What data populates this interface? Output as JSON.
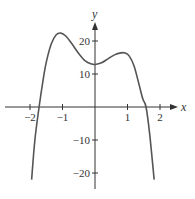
{
  "chart_data": {
    "type": "line",
    "title": "",
    "xlabel": "x",
    "ylabel": "y",
    "xlim": [
      -2.3,
      2.5
    ],
    "ylim": [
      -25,
      26
    ],
    "grid": false,
    "legend": null,
    "x_ticks": [
      -2,
      -1,
      1,
      2
    ],
    "x_tick_labels": [
      "−2",
      "−1",
      "1",
      "2"
    ],
    "y_ticks": [
      20,
      10,
      -10,
      -20
    ],
    "y_tick_labels": [
      "20",
      "10",
      "−10",
      "−20"
    ],
    "series": [
      {
        "name": "f(x)",
        "color": "#555555",
        "points": [
          [
            -1.95,
            -22
          ],
          [
            -1.85,
            -10
          ],
          [
            -1.72,
            0
          ],
          [
            -1.6,
            8
          ],
          [
            -1.5,
            13.5
          ],
          [
            -1.35,
            19
          ],
          [
            -1.2,
            21.8
          ],
          [
            -1.05,
            22.4
          ],
          [
            -0.9,
            21.5
          ],
          [
            -0.7,
            19
          ],
          [
            -0.5,
            16.2
          ],
          [
            -0.3,
            14
          ],
          [
            -0.1,
            13
          ],
          [
            0,
            12.9
          ],
          [
            0.2,
            13.4
          ],
          [
            0.4,
            14.6
          ],
          [
            0.6,
            15.8
          ],
          [
            0.8,
            16.4
          ],
          [
            0.92,
            16.4
          ],
          [
            1.05,
            15.5
          ],
          [
            1.2,
            12.5
          ],
          [
            1.35,
            7
          ],
          [
            1.47,
            2.5
          ],
          [
            1.57,
            0
          ],
          [
            1.68,
            -8
          ],
          [
            1.82,
            -22
          ]
        ]
      }
    ],
    "annotations": {
      "local_max_left": [
        -1.05,
        22.4
      ],
      "local_min": [
        0,
        12.9
      ],
      "local_max_right": [
        0.92,
        16.4
      ],
      "x_intercepts": [
        -1.72,
        1.57
      ]
    }
  },
  "axes": {
    "x_label": "x",
    "y_label": "y",
    "color": "#333333"
  }
}
